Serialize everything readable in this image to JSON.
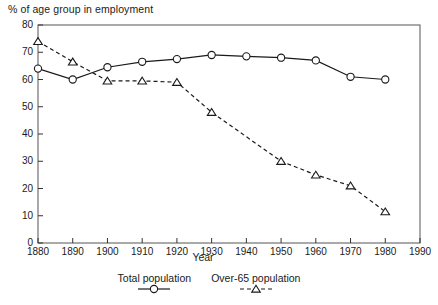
{
  "chart_data": {
    "type": "line",
    "title": "",
    "ylabel": "% of age group in employment",
    "xlabel": "Year",
    "xlim": [
      1880,
      1990
    ],
    "ylim": [
      0,
      80
    ],
    "xticks": [
      1880,
      1890,
      1900,
      1910,
      1920,
      1930,
      1940,
      1950,
      1960,
      1970,
      1980,
      1990
    ],
    "yticks": [
      0,
      10,
      20,
      30,
      40,
      50,
      60,
      70,
      80
    ],
    "grid": false,
    "legend_position": "bottom",
    "x": [
      1880,
      1890,
      1900,
      1910,
      1920,
      1930,
      1940,
      1950,
      1960,
      1970,
      1980
    ],
    "series": [
      {
        "name": "Total population",
        "marker": "circle",
        "linestyle": "solid",
        "color": "#1a1a1a",
        "x": [
          1880,
          1890,
          1900,
          1910,
          1920,
          1930,
          1940,
          1950,
          1960,
          1970,
          1980
        ],
        "values": [
          64,
          60,
          64.5,
          66.5,
          67.5,
          69,
          68.5,
          68,
          67,
          61,
          60
        ]
      },
      {
        "name": "Over-65 population",
        "marker": "triangle",
        "linestyle": "dashed",
        "color": "#1a1a1a",
        "x": [
          1880,
          1890,
          1900,
          1910,
          1920,
          1930,
          1950,
          1960,
          1970,
          1980
        ],
        "values": [
          74,
          66.5,
          59.5,
          59.5,
          59,
          48,
          30,
          25,
          21,
          11.5
        ]
      }
    ]
  },
  "axes": {
    "ylabel": "% of age group in employment",
    "xlabel": "Year",
    "ytick_labels": [
      "80",
      "70",
      "60",
      "50",
      "40",
      "30",
      "20",
      "10",
      "0"
    ],
    "xtick_labels": [
      "1880",
      "1890",
      "1900",
      "1910",
      "1920",
      "1930",
      "1940",
      "1950",
      "1960",
      "1970",
      "1980",
      "1990"
    ]
  },
  "legend": {
    "items": [
      {
        "label": "Total population",
        "marker": "circle",
        "linestyle": "solid"
      },
      {
        "label": "Over-65 population",
        "marker": "triangle",
        "linestyle": "dashed"
      }
    ]
  }
}
